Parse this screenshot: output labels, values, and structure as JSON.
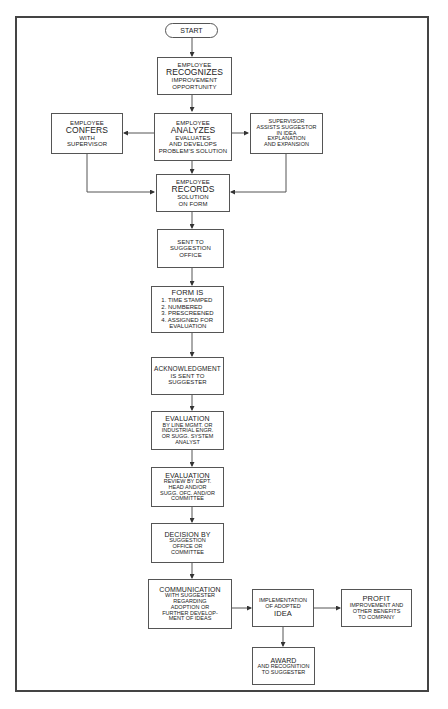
{
  "diagram": {
    "type": "flowchart",
    "start": "START",
    "nodes": {
      "recognizes": {
        "l1": "EMPLOYEE",
        "l2": "RECOGNIZES",
        "l3": "IMPROVEMENT",
        "l4": "OPPORTUNITY"
      },
      "confers": {
        "l1": "EMPLOYEE",
        "l2": "CONFERS",
        "l3": "WITH",
        "l4": "SUPERVISOR"
      },
      "analyzes": {
        "l1": "EMPLOYEE",
        "l2": "ANALYZES",
        "l3": "EVALUATES",
        "l4": "AND DEVELOPS",
        "l5": "PROBLEM'S SOLUTION"
      },
      "supervisor": {
        "l1": "SUPERVISOR",
        "l2": "ASSISTS SUGGESTOR",
        "l3": "IN IDEA",
        "l4": "EXPLANATION",
        "l5": "AND EXPANSION"
      },
      "records": {
        "l1": "EMPLOYEE",
        "l2": "RECORDS",
        "l3": "SOLUTION",
        "l4": "ON FORM"
      },
      "sent": {
        "l1": "SENT TO",
        "l2": "SUGGESTION",
        "l3": "OFFICE"
      },
      "form": {
        "title": "FORM IS",
        "items": [
          "1. TIME STAMPED",
          "2. NUMBERED",
          "3. PRESCREENED",
          "4. ASSIGNED FOR"
        ],
        "tail": "EVALUATION"
      },
      "ack": {
        "l1": "ACKNOWLEDGMENT",
        "l2": "IS SENT TO",
        "l3": "SUGGESTER"
      },
      "eval1": {
        "l1": "EVALUATION",
        "l2": "BY LINE MGMT. OR",
        "l3": "INDUSTRIAL ENGR.",
        "l4": "OR SUGG. SYSTEM",
        "l5": "ANALYST"
      },
      "eval2": {
        "l1": "EVALUATION",
        "l2": "REVIEW BY DEPT.",
        "l3": "HEAD AND/OR",
        "l4": "SUGG. OFC. AND/OR",
        "l5": "COMMITTEE"
      },
      "decision": {
        "l1": "DECISION BY",
        "l2": "SUGGESTION",
        "l3": "OFFICE OR",
        "l4": "COMMITTEE"
      },
      "communication": {
        "l1": "COMMUNICATION",
        "l2": "WITH SUGGESTER",
        "l3": "REGARDING",
        "l4": "ADOPTION OR",
        "l5": "FURTHER DEVELOP-",
        "l6": "MENT OF IDEAS"
      },
      "implementation": {
        "l1": "IMPLEMENTATION",
        "l2": "OF ADOPTED",
        "l3": "IDEA"
      },
      "profit": {
        "l1": "PROFIT",
        "l2": "IMPROVEMENT AND",
        "l3": "OTHER BENEFITS",
        "l4": "TO COMPANY"
      },
      "award": {
        "l1": "AWARD",
        "l2": "AND RECOGNITION",
        "l3": "TO SUGGESTER"
      }
    },
    "edges": [
      [
        "start",
        "recognizes"
      ],
      [
        "recognizes",
        "analyzes"
      ],
      [
        "analyzes",
        "confers"
      ],
      [
        "analyzes",
        "supervisor"
      ],
      [
        "analyzes",
        "records"
      ],
      [
        "confers",
        "records"
      ],
      [
        "supervisor",
        "records"
      ],
      [
        "records",
        "sent"
      ],
      [
        "sent",
        "form"
      ],
      [
        "form",
        "ack"
      ],
      [
        "ack",
        "eval1"
      ],
      [
        "eval1",
        "eval2"
      ],
      [
        "eval2",
        "decision"
      ],
      [
        "decision",
        "communication"
      ],
      [
        "communication",
        "implementation"
      ],
      [
        "implementation",
        "profit"
      ],
      [
        "implementation",
        "award"
      ]
    ]
  }
}
